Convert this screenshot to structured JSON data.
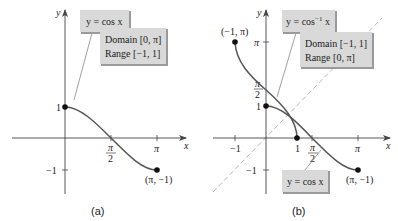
{
  "figure": {
    "panels": [
      {
        "id": "a",
        "caption": "(a)",
        "axis_x_label": "x",
        "axis_y_label": "y",
        "function_label": "y = cos x",
        "info_box": {
          "line1": "Domain [0, π]",
          "line2": "Range [−1, 1]"
        },
        "x_ticks": [
          {
            "label_num": "π",
            "label_den": "2",
            "value": 1.5708
          },
          {
            "label": "π",
            "value": 3.1416
          }
        ],
        "y_ticks": [
          {
            "label": "1",
            "value": 1
          },
          {
            "label": "−1",
            "value": -1
          }
        ],
        "points": [
          {
            "label": "",
            "x": 0,
            "y": 1
          },
          {
            "label": "(π, −1)",
            "x": 3.1416,
            "y": -1
          }
        ]
      },
      {
        "id": "b",
        "caption": "(b)",
        "axis_x_label": "x",
        "axis_y_label": "y",
        "function_label_main": "y = cos",
        "function_label_sup": "−1",
        "function_label_tail": " x",
        "function_label_2": "y = cos x",
        "info_box": {
          "line1": "Domain [−1, 1]",
          "line2": "Range [0, π]"
        },
        "x_ticks": [
          {
            "label": "−1",
            "value": -1
          },
          {
            "label": "1",
            "value": 1
          },
          {
            "label_num": "π",
            "label_den": "2",
            "value": 1.5708
          },
          {
            "label": "π",
            "value": 3.1416
          }
        ],
        "y_ticks": [
          {
            "label": "π",
            "value": 3.1416
          },
          {
            "label_num": "π",
            "label_den": "2",
            "value": 1.5708
          },
          {
            "label": "1",
            "value": 1
          },
          {
            "label": "−1",
            "value": -1
          }
        ],
        "points": [
          {
            "label": "(−1, π)",
            "x": -1,
            "y": 3.1416
          },
          {
            "label": "",
            "x": 0,
            "y": 1
          },
          {
            "label": "",
            "x": 1,
            "y": 0
          },
          {
            "label": "(π, −1)",
            "x": 3.1416,
            "y": -1
          }
        ],
        "reference_line": "y = x (dashed)"
      }
    ],
    "colors": {
      "curve": "#555555",
      "axis": "#444444",
      "box_fill": "#d9d9d9",
      "box_shadow": "#9a9a9a",
      "dashed": "#b5b5b5"
    }
  }
}
